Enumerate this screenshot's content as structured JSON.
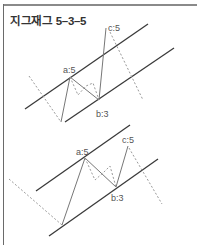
{
  "title": "지그재그 5–3–5",
  "diagrams": [
    {
      "name": "top",
      "labels": {
        "a": "a:5",
        "b": "b:3",
        "c": "c:5"
      }
    },
    {
      "name": "bottom",
      "labels": {
        "a": "a:5",
        "b": "b:3",
        "c": "c:5"
      }
    }
  ],
  "colors": {
    "channel": "#3a3a3a",
    "wave": "#777777",
    "dotted": "#9a9a9a",
    "text": "#555555"
  }
}
